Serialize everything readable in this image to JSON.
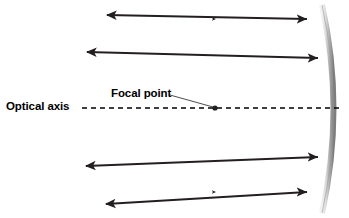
{
  "diagram": {
    "labels": {
      "optical_axis": "Optical axis",
      "focal_point": "Focal point"
    },
    "colors": {
      "ray": "#231f20",
      "ray_fade": "#c9c9c9",
      "mirror_dark": "#8c8c8c",
      "mirror_light": "#e8e8e8",
      "axis": "#000000",
      "background": "#ffffff"
    },
    "geometry": {
      "focal_point": {
        "x": 215,
        "y": 108
      },
      "optical_axis": {
        "y": 108,
        "x_start": 82,
        "x_end": 340
      },
      "mirror": {
        "top": {
          "x": 322,
          "y": 5
        },
        "bottom": {
          "x": 322,
          "y": 213
        },
        "vertex": {
          "x": 339,
          "y": 109
        },
        "thickness": 5
      },
      "incoming_rays": [
        {
          "id": "ray-1",
          "y": 19,
          "x_start": 96,
          "x_end": 307
        },
        {
          "id": "ray-2",
          "y": 58,
          "x_start": 85,
          "x_end": 318
        },
        {
          "id": "ray-3",
          "y": 157,
          "x_start": 85,
          "x_end": 318
        },
        {
          "id": "ray-4",
          "y": 192,
          "x_start": 96,
          "x_end": 307
        }
      ],
      "reflected_rays": [
        {
          "id": "reflected-1",
          "from": {
            "x": 307,
            "y": 19
          },
          "to": {
            "x": 105,
            "y": 14
          }
        },
        {
          "id": "reflected-2",
          "from": {
            "x": 318,
            "y": 58
          },
          "to": {
            "x": 85,
            "y": 51
          }
        },
        {
          "id": "reflected-3",
          "from": {
            "x": 318,
            "y": 157
          },
          "to": {
            "x": 84,
            "y": 167
          }
        },
        {
          "id": "reflected-4",
          "from": {
            "x": 307,
            "y": 192
          },
          "to": {
            "x": 104,
            "y": 205
          }
        }
      ]
    }
  }
}
